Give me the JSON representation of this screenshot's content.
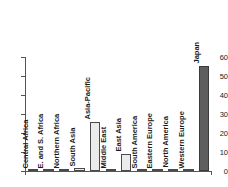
{
  "chart_data": {
    "type": "bar",
    "title": "",
    "subtitle": "",
    "xlabel": "",
    "ylabel": "",
    "ylim": [
      0,
      60
    ],
    "yticks": [
      0,
      10,
      20,
      30,
      40,
      50,
      60
    ],
    "ytick_labels": [
      "0",
      "10",
      "20",
      "30",
      "40",
      "50",
      "60"
    ],
    "grid": false,
    "legend": null,
    "categories": [
      "Central Africa",
      "E. and S. Africa",
      "Northern Africa",
      "South Asia",
      "Asia-Pacific",
      "Middle East",
      "East Asia",
      "South America",
      "Eastern Europe",
      "North America",
      "Western Europe",
      "Japan"
    ],
    "values": [
      0,
      0,
      0,
      1.5,
      25.8,
      0,
      9,
      0,
      0,
      0.6,
      0,
      55.3
    ],
    "bar_colors": [
      "#ebebeb",
      "#ebebeb",
      "#ebebeb",
      "#ebebeb",
      "#ebebeb",
      "#ebebeb",
      "#ebebeb",
      "#ebebeb",
      "#ebebeb",
      "#ebebeb",
      "#ebebeb",
      "#5e5e5e"
    ],
    "bar_edge_color": "#4a4a4a",
    "axis_color": "#555555",
    "label_color": "#1a1a1a",
    "background": "#ffffff",
    "label_rotation_degrees": 90
  }
}
